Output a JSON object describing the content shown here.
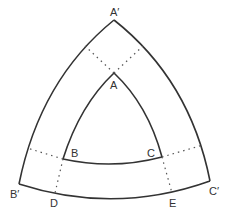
{
  "diagram": {
    "title": "",
    "colors": {
      "stroke": "#333333",
      "background": "#ffffff"
    },
    "outer_triangle": {
      "vertices": [
        {
          "id": "A'",
          "x": 114,
          "y": 20
        },
        {
          "id": "B'",
          "x": 19,
          "y": 184
        },
        {
          "id": "C'",
          "x": 210,
          "y": 181
        }
      ]
    },
    "inner_triangle": {
      "vertices": [
        {
          "id": "A",
          "x": 114,
          "y": 73
        },
        {
          "id": "B",
          "x": 63,
          "y": 159
        },
        {
          "id": "C",
          "x": 162,
          "y": 157
        }
      ]
    },
    "labels": {
      "A_prime": "A′",
      "A": "A",
      "B": "B",
      "C": "C",
      "B_prime": "B′",
      "C_prime": "C′",
      "D": "D",
      "E": "E"
    },
    "dotted_connectors": [
      {
        "from": "A",
        "to": "left outer edge"
      },
      {
        "from": "A",
        "to": "right outer edge"
      },
      {
        "from": "B",
        "to": "left outer edge"
      },
      {
        "from": "B",
        "to": "D"
      },
      {
        "from": "C",
        "to": "right outer edge"
      },
      {
        "from": "C",
        "to": "E"
      }
    ]
  }
}
